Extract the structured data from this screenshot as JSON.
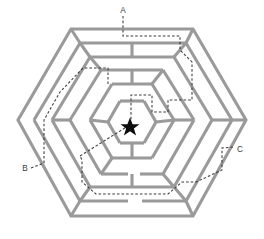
{
  "figure": {
    "kind": "hexagonal-maze-diagram",
    "width": 264,
    "height": 239,
    "background_color": "#ffffff",
    "wall_color": "#9a9a9a",
    "path_color": "#3a3a3a",
    "goal_color": "#0d0d0d"
  },
  "labels": {
    "a": "A",
    "b": "B",
    "c": "C"
  },
  "entrances": [
    {
      "id": "A",
      "label": "A",
      "side": "top",
      "x": 123,
      "y": 10
    },
    {
      "id": "B",
      "label": "B",
      "side": "lower-left",
      "x": 25,
      "y": 168
    },
    {
      "id": "C",
      "label": "C",
      "side": "lower-right",
      "x": 240,
      "y": 150
    }
  ],
  "goal": {
    "name": "star-goal",
    "x": 130,
    "y": 127,
    "outer_radius": 9.5,
    "inner_radius": 4.0
  },
  "geometry": {
    "center": {
      "x": 131,
      "y": 122
    },
    "ring_radii": [
      105,
      88,
      70,
      53,
      36,
      20
    ],
    "orientation": "flat-top-hexagon"
  },
  "paths": {
    "a_to_goal": "A enters at the top, runs down, jogs right along the second ring, turns down the right side, cuts back left through the middle rings and descends straight into the star.",
    "b_to_goal": "B enters at the lower left, climbs the outer left corridor, crosses right, then angles up-right diagonally to the star.",
    "c_to_goal": "C enters at the lower right, runs down-left, then follows the long bottom corridor left and up into the inner rings."
  }
}
